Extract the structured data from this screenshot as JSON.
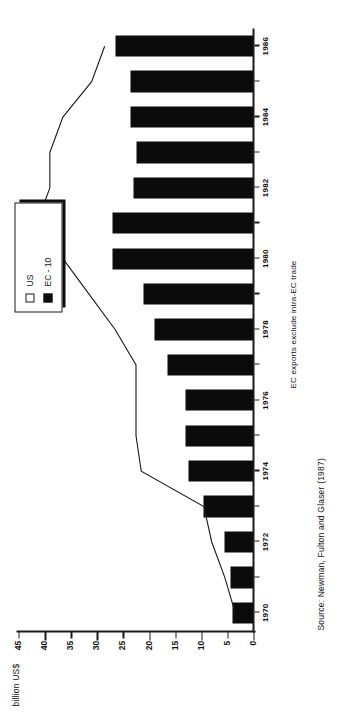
{
  "chart_data": {
    "type": "bar",
    "title": "",
    "subtitle": "",
    "xlabel": "",
    "ylabel": "billion US$",
    "ylim": [
      0,
      45
    ],
    "ytick_step": 5,
    "yticks": [
      45,
      40,
      35,
      30,
      25,
      20,
      15,
      10,
      5,
      0
    ],
    "ytick_labels": [
      "45",
      "40",
      "35",
      "30",
      "25",
      "20",
      "15",
      "10",
      "5",
      "0"
    ],
    "grid": false,
    "legend_position": "top-right",
    "categories": [
      "1970",
      "1971",
      "1972",
      "1973",
      "1974",
      "1975",
      "1976",
      "1977",
      "1978",
      "1979",
      "1980",
      "1981",
      "1982",
      "1983",
      "1984",
      "1985",
      "1986"
    ],
    "xtick_labels": [
      "1970",
      "",
      "1972",
      "",
      "1974",
      "",
      "1976",
      "",
      "1978",
      "",
      "1980",
      "",
      "1982",
      "",
      "1984",
      "",
      "1986"
    ],
    "series": [
      {
        "name": "EC - 10",
        "type": "bar",
        "color": "#0b0b0b",
        "values": [
          4.0,
          4.5,
          5.5,
          9.5,
          12.5,
          13.0,
          13.0,
          16.5,
          19.0,
          21.0,
          27.0,
          27.0,
          23.0,
          22.5,
          23.5,
          23.5,
          26.5
        ]
      },
      {
        "name": "US",
        "type": "line",
        "color": "#1a1a1a",
        "marker": "none",
        "values": [
          3.5,
          5.5,
          8.0,
          9.5,
          21.5,
          22.5,
          22.5,
          22.5,
          26.5,
          31.5,
          36.5,
          41.5,
          39.0,
          39.0,
          36.5,
          31.0,
          28.5
        ]
      }
    ],
    "annotations": [
      "EC exports exclude intra-EC trade",
      "Source: Newman, Fulton and Glaser (1987)"
    ]
  },
  "axis": {
    "value_title": "billion US$"
  },
  "legend": {
    "items": [
      {
        "label": "US",
        "swatch": "hollow"
      },
      {
        "label": "EC - 10",
        "swatch": "filled"
      }
    ]
  },
  "notes": {
    "trade": "EC exports exclude intra-EC trade",
    "source": "Source: Newman, Fulton and Glaser (1987)"
  }
}
